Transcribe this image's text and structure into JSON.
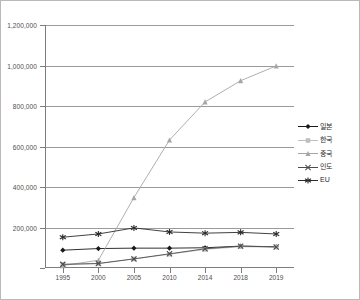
{
  "chart_data": {
    "type": "line",
    "title": "",
    "xlabel": "",
    "ylabel": "",
    "categories": [
      "1995",
      "2000",
      "2005",
      "2010",
      "2014",
      "2018",
      "2019"
    ],
    "ylim": [
      0,
      1200000
    ],
    "ytick_labels": [
      "1,200,000",
      "1,000,000",
      "800,000",
      "600,000",
      "400,000",
      "200,000"
    ],
    "ytick_values": [
      1200000,
      1000000,
      800000,
      600000,
      400000,
      200000
    ],
    "grid": true,
    "legend_position": "right",
    "series": [
      {
        "name": "일본",
        "marker": "diamond",
        "color": "#1a1a1a",
        "values": [
          88000,
          96000,
          98000,
          98000,
          100000,
          108000,
          105000
        ]
      },
      {
        "name": "한국",
        "marker": "square",
        "color": "#bfbfbf",
        "values": [
          18000,
          22000,
          45000,
          68000,
          92000,
          105000,
          103000
        ]
      },
      {
        "name": "중국",
        "marker": "triangle",
        "color": "#a6a6a6",
        "values": [
          12000,
          38000,
          348000,
          632000,
          820000,
          925000,
          998000
        ]
      },
      {
        "name": "인도",
        "marker": "x",
        "color": "#4d4d4d",
        "values": [
          18000,
          22000,
          45000,
          70000,
          95000,
          108000,
          104000
        ]
      },
      {
        "name": "EU",
        "marker": "asterisk",
        "color": "#2b2b2b",
        "values": [
          152000,
          168000,
          198000,
          178000,
          172000,
          176000,
          168000
        ]
      }
    ]
  }
}
